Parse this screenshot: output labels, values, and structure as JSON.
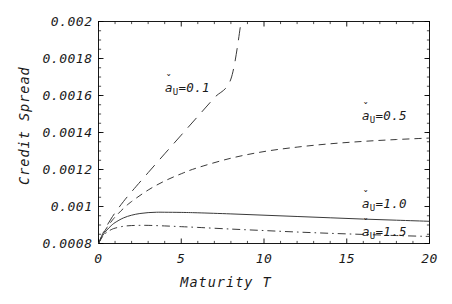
{
  "chart_data": {
    "type": "line",
    "title": "",
    "xlabel": "Maturity T",
    "ylabel": "Credit Spread",
    "xlim": [
      0,
      20
    ],
    "ylim": [
      0.0008,
      0.002
    ],
    "grid": false,
    "legend_position": "inline-annotations",
    "xticks": [
      {
        "value": 0,
        "label": "0"
      },
      {
        "value": 5,
        "label": "5"
      },
      {
        "value": 10,
        "label": "10"
      },
      {
        "value": 15,
        "label": "15"
      },
      {
        "value": 20,
        "label": "20"
      }
    ],
    "yticks": [
      {
        "value": 0.0008,
        "label": "0.0008"
      },
      {
        "value": 0.001,
        "label": "0.001"
      },
      {
        "value": 0.0012,
        "label": "0.0012"
      },
      {
        "value": 0.0014,
        "label": "0.0014"
      },
      {
        "value": 0.0016,
        "label": "0.0016"
      },
      {
        "value": 0.0018,
        "label": "0.0018"
      },
      {
        "value": 0.002,
        "label": "0.002"
      }
    ],
    "minor_tick_step_x": 1,
    "minor_tick_step_y": 5e-05,
    "line_color": "#3a3a3a",
    "frame_color": "#000000",
    "series": [
      {
        "name": "a_U=0.1",
        "label_prefix": "a",
        "label_subscript": "U",
        "label_value": "=0.1",
        "dash": "long-dash",
        "annotation_x": 165,
        "annotation_y": 80,
        "x": [
          0,
          0.25,
          0.5,
          0.75,
          1,
          1.5,
          2,
          3,
          4,
          5,
          6,
          7,
          8,
          8.62
        ],
        "y": [
          0.0008,
          0.000852,
          0.000895,
          0.000932,
          0.000966,
          0.001026,
          0.00108,
          0.001183,
          0.001285,
          0.001386,
          0.001487,
          0.001588,
          0.001689,
          0.002
        ]
      },
      {
        "name": "a_U=0.5",
        "label_prefix": "a",
        "label_subscript": "U",
        "label_value": "=0.5",
        "dash": "dashed",
        "annotation_x": 362,
        "annotation_y": 108,
        "x": [
          0,
          0.25,
          0.5,
          0.75,
          1,
          1.5,
          2,
          3,
          4,
          5,
          6,
          8,
          10,
          12,
          14,
          16,
          18,
          20
        ],
        "y": [
          0.0008,
          0.000848,
          0.000885,
          0.000916,
          0.000943,
          0.000989,
          0.001027,
          0.001089,
          0.001138,
          0.001177,
          0.00121,
          0.001261,
          0.001297,
          0.001321,
          0.001339,
          0.001352,
          0.001362,
          0.00137
        ]
      },
      {
        "name": "a_U=1.0",
        "label_prefix": "a",
        "label_subscript": "U",
        "label_value": "=1.0",
        "dash": "solid",
        "annotation_x": 362,
        "annotation_y": 196,
        "x": [
          0,
          0.25,
          0.5,
          0.75,
          1,
          1.5,
          2,
          2.5,
          3,
          3.5,
          4,
          5,
          6,
          8,
          10,
          12,
          14,
          16,
          18,
          20
        ],
        "y": [
          0.0008,
          0.000843,
          0.000872,
          0.000895,
          0.000913,
          0.000938,
          0.000953,
          0.000962,
          0.000967,
          0.000969,
          0.000969,
          0.000968,
          0.000966,
          0.00096,
          0.000953,
          0.000946,
          0.000939,
          0.000932,
          0.000926,
          0.00092
        ]
      },
      {
        "name": "a_U=1.5",
        "label_prefix": "a",
        "label_subscript": "U",
        "label_value": "=1.5",
        "dash": "dash-dot",
        "annotation_x": 362,
        "annotation_y": 224,
        "x": [
          0,
          0.25,
          0.5,
          0.75,
          1,
          1.5,
          2,
          2.5,
          3,
          4,
          5,
          6,
          8,
          10,
          12,
          14,
          16,
          18,
          20
        ],
        "y": [
          0.0008,
          0.000838,
          0.00086,
          0.000874,
          0.000883,
          0.000893,
          0.000897,
          0.000898,
          0.000898,
          0.000895,
          0.000891,
          0.000887,
          0.000878,
          0.00087,
          0.000862,
          0.000855,
          0.000849,
          0.000843,
          0.000838
        ]
      }
    ]
  }
}
